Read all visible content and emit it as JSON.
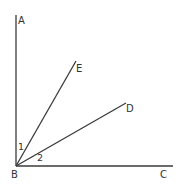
{
  "diagram": {
    "type": "geometry-angles",
    "vertex": {
      "label": "B",
      "x": 16,
      "y": 166
    },
    "rays": [
      {
        "name": "BA",
        "end_label": "A",
        "x2": 16,
        "y2": 15
      },
      {
        "name": "BE",
        "end_label": "E",
        "x2": 76,
        "y2": 61
      },
      {
        "name": "BD",
        "end_label": "D",
        "x2": 126,
        "y2": 103
      },
      {
        "name": "BC",
        "end_label": "C",
        "x2": 173,
        "y2": 166
      }
    ],
    "labels": {
      "A": "A",
      "B": "B",
      "C": "C",
      "D": "D",
      "E": "E"
    },
    "angle_labels": {
      "angle1": "1",
      "angle2": "2"
    },
    "colors": {
      "line": "#3a3a3a",
      "text": "#333333",
      "background": "#ffffff"
    }
  }
}
